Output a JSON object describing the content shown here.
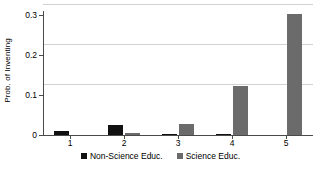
{
  "chart_data": {
    "type": "bar",
    "title": "",
    "xlabel": "",
    "ylabel": "Prob. of Inventing",
    "categories": [
      "1",
      "2",
      "3",
      "4",
      "5"
    ],
    "series": [
      {
        "name": "Non-Science Educ.",
        "color": "#111111",
        "values": [
          0.01,
          0.025,
          0.003,
          0.003,
          0.0
        ]
      },
      {
        "name": "Science Educ.",
        "color": "#6b6b6b",
        "values": [
          0.0,
          0.004,
          0.027,
          0.123,
          0.302
        ]
      }
    ],
    "ylim": [
      0,
      0.31
    ],
    "yticks": [
      0,
      0.1,
      0.2,
      0.3
    ],
    "ytick_labels": [
      "0",
      "0.1",
      "0.2",
      "0.3"
    ],
    "grid": "horizontal",
    "legend_position": "bottom-center"
  }
}
